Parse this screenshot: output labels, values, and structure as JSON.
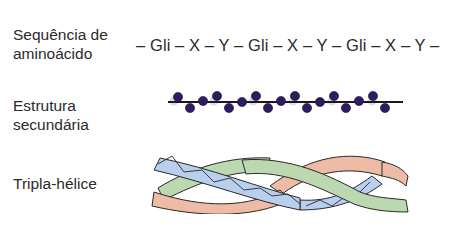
{
  "diagram": {
    "rows": [
      {
        "label": "Sequência de aminoácido",
        "label_lines": [
          "Sequência de",
          "aminoácido"
        ],
        "content_type": "text",
        "sequence": "– Gli – X – Y – Gli – X – Y – Gli – X – Y –"
      },
      {
        "label": "Estrutura secundária",
        "label_lines": [
          "Estrutura",
          "secundária"
        ],
        "content_type": "bead-chain",
        "bead_color": "#2e1c5e",
        "bead_count": 18,
        "line_color": "#1a1a1a"
      },
      {
        "label": "Tripla-hélice",
        "label_lines": [
          "Tripla-hélice"
        ],
        "content_type": "triple-helix",
        "strands": [
          {
            "name": "blue-strand",
            "color": "#b9cfee"
          },
          {
            "name": "green-strand",
            "color": "#bcd8b0"
          },
          {
            "name": "salmon-strand",
            "color": "#eebca6"
          }
        ],
        "outline_color": "#2a2a2a"
      }
    ]
  }
}
